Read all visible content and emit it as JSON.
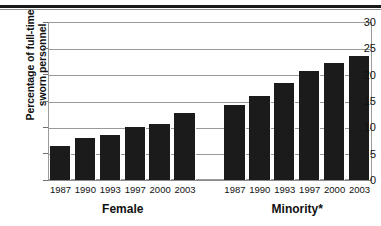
{
  "figure": {
    "y_axis_title_line1": "Percentage of full-time",
    "y_axis_title_line2": "sworn personnel",
    "group_labels": [
      "Female",
      "Minority*"
    ]
  },
  "chart_data": {
    "type": "bar",
    "title": "",
    "xlabel": "",
    "ylabel": "Percentage of full-time sworn personnel",
    "ylim": [
      0,
      30
    ],
    "ytick_values": [
      0,
      5,
      10,
      15,
      20,
      25,
      30
    ],
    "ytick_labels": [
      "0",
      "5",
      "10",
      "15",
      "20",
      "25",
      "30"
    ],
    "grid": true,
    "legend": "none",
    "bar_color": "#1b1b1b",
    "groups": [
      {
        "name": "Female",
        "categories": [
          "1987",
          "1990",
          "1993",
          "1997",
          "2000",
          "2003"
        ],
        "values": [
          6.5,
          7.9,
          8.6,
          10.1,
          10.7,
          12.7
        ]
      },
      {
        "name": "Minority*",
        "categories": [
          "1987",
          "1990",
          "1993",
          "1997",
          "2000",
          "2003"
        ],
        "values": [
          14.3,
          15.9,
          18.5,
          20.7,
          22.3,
          23.6
        ]
      }
    ]
  }
}
